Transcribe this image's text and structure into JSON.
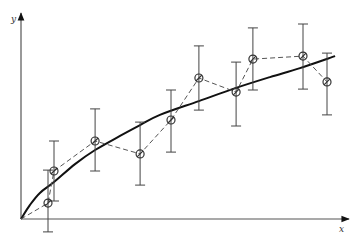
{
  "chart_data": {
    "type": "scatter",
    "title": "",
    "xlabel": "x",
    "ylabel": "y",
    "grid": false,
    "legend": null,
    "xlim": [
      0,
      11
    ],
    "ylim": [
      -0.5,
      6.9
    ],
    "series": [
      {
        "name": "measurements",
        "style": "circle-dot markers with error bars, connected by dashed line",
        "points": [
          {
            "x": 0.9,
            "y": 0.53,
            "err_low": -0.43,
            "err_high": 1.63
          },
          {
            "x": 1.1,
            "y": 1.6,
            "err_low": 0.6,
            "err_high": 2.6
          },
          {
            "x": 2.47,
            "y": 2.6,
            "err_low": 1.6,
            "err_high": 3.67
          },
          {
            "x": 3.97,
            "y": 2.17,
            "err_low": 1.13,
            "err_high": 3.23
          },
          {
            "x": 5.0,
            "y": 3.3,
            "err_low": 2.23,
            "err_high": 4.3
          },
          {
            "x": 5.93,
            "y": 4.7,
            "err_low": 3.63,
            "err_high": 5.77
          },
          {
            "x": 7.17,
            "y": 4.23,
            "err_low": 3.1,
            "err_high": 5.23
          },
          {
            "x": 7.73,
            "y": 5.33,
            "err_low": 4.3,
            "err_high": 6.37
          },
          {
            "x": 9.4,
            "y": 5.43,
            "err_low": 4.33,
            "err_high": 6.5
          },
          {
            "x": 10.2,
            "y": 4.57,
            "err_low": 3.47,
            "err_high": 5.53
          }
        ]
      },
      {
        "name": "fit-curve",
        "style": "solid thick concave curve from origin",
        "points": [
          {
            "x": 0.0,
            "y": 0.0
          },
          {
            "x": 0.3,
            "y": 0.47
          },
          {
            "x": 0.63,
            "y": 0.87
          },
          {
            "x": 1.1,
            "y": 1.23
          },
          {
            "x": 1.8,
            "y": 1.83
          },
          {
            "x": 2.47,
            "y": 2.3
          },
          {
            "x": 3.3,
            "y": 2.77
          },
          {
            "x": 3.97,
            "y": 3.13
          },
          {
            "x": 4.63,
            "y": 3.47
          },
          {
            "x": 5.93,
            "y": 3.93
          },
          {
            "x": 7.17,
            "y": 4.37
          },
          {
            "x": 8.3,
            "y": 4.73
          },
          {
            "x": 9.3,
            "y": 5.03
          },
          {
            "x": 10.47,
            "y": 5.43
          }
        ]
      }
    ]
  },
  "axes": {
    "x_label": "x",
    "y_label": "y"
  },
  "layout": {
    "origin_px": [
      21,
      219
    ],
    "scale_px": 30,
    "x_axis_end_px": 349,
    "y_axis_end_px": 13,
    "marker_radius": 4,
    "cap_half_width": 5
  }
}
